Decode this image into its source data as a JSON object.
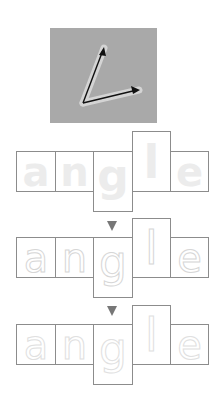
{
  "photo": {
    "description": "two arrows forming an angle",
    "icon": "angle-arrows-icon",
    "background": "#a9a9a9"
  },
  "word": "angle",
  "rows": [
    {
      "style": "solid",
      "letters": [
        {
          "char": "a",
          "shape": "x-height"
        },
        {
          "char": "n",
          "shape": "x-height"
        },
        {
          "char": "g",
          "shape": "descender"
        },
        {
          "char": "l",
          "shape": "ascender"
        },
        {
          "char": "e",
          "shape": "x-height"
        }
      ]
    },
    {
      "style": "dotted",
      "letters": [
        {
          "char": "a",
          "shape": "x-height"
        },
        {
          "char": "n",
          "shape": "x-height"
        },
        {
          "char": "g",
          "shape": "descender"
        },
        {
          "char": "l",
          "shape": "ascender"
        },
        {
          "char": "e",
          "shape": "x-height"
        }
      ]
    },
    {
      "style": "dotted-faint",
      "letters": [
        {
          "char": "a",
          "shape": "x-height"
        },
        {
          "char": "n",
          "shape": "x-height"
        },
        {
          "char": "g",
          "shape": "descender"
        },
        {
          "char": "l",
          "shape": "ascender"
        },
        {
          "char": "e",
          "shape": "x-height"
        }
      ]
    }
  ],
  "arrows": [
    {
      "icon": "down-triangle-icon",
      "color": "#777777"
    },
    {
      "icon": "down-triangle-icon",
      "color": "#777777"
    }
  ],
  "colors": {
    "border": "#8c8c8c",
    "letter_solid": "#ececec",
    "letter_dotted": "#d6d6d6"
  }
}
